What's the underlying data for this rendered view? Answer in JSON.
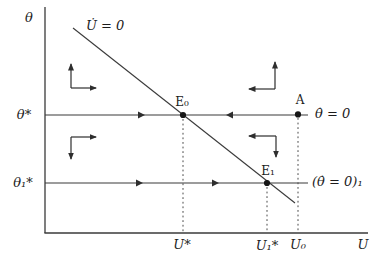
{
  "colors": {
    "background": "#ffffff",
    "line": "#3a3a3a",
    "text": "#1c1c1c",
    "point": "#161616"
  },
  "axes": {
    "y_label": "θ",
    "x_label": "U"
  },
  "loci": {
    "u_dot_label": "U̇ = 0",
    "theta_dot_label": "θ̇ = 0",
    "theta_dot_1_label": "(θ̇ = 0)₁"
  },
  "points": {
    "e0_label": "E₀",
    "e1_label": "E₁",
    "a_label": "A"
  },
  "y_ticks": {
    "theta_star": "θ*",
    "theta_1_star": "θ₁*"
  },
  "x_ticks": {
    "u_star": "U*",
    "u_1_star": "U₁*",
    "u_0": "U₀"
  }
}
